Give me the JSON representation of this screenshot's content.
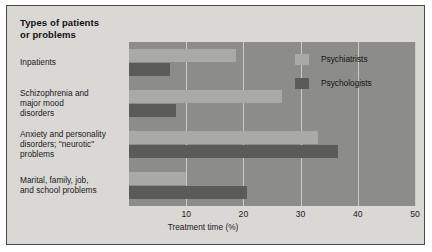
{
  "figure": {
    "panel_bg": "#d9d8d4",
    "plot_bg": "#8c8c8a",
    "border_color": "#4a4a48"
  },
  "legend": {
    "position": "top-right-inside-plot",
    "entries": [
      {
        "label": "Psychiatrists",
        "color": "#a9a9a6"
      },
      {
        "label": "Psychologists",
        "color": "#5b5b5a"
      }
    ]
  },
  "chart_data": {
    "type": "bar",
    "orientation": "horizontal",
    "xlabel": "Treatment time (%)",
    "ylabel": "",
    "xlim": [
      0,
      50
    ],
    "xticks": [
      10,
      20,
      30,
      40,
      50
    ],
    "xtick_labels": [
      "10",
      "20",
      "30",
      "40",
      "50"
    ],
    "grid": true,
    "grid_axis": "x",
    "legend_position": "upper right",
    "categories": [
      "Inpatients",
      "Schizophrenia and major mood disorders",
      "Anxiety and personality disorders; \"neurotic\" problems",
      "Marital, family, job, and school problems"
    ],
    "category_labels_display": [
      "Inpatients",
      "Schizophrenia and\nmajor mood\ndisorders",
      "Anxiety and personality\ndisorders; \"neurotic\"\nproblems",
      "Marital, family, job,\nand school problems"
    ],
    "series": [
      {
        "name": "Psychiatrists",
        "color": "#a9a9a6",
        "values": [
          18.7,
          26.7,
          33.0,
          10.0
        ]
      },
      {
        "name": "Psychologists",
        "color": "#5b5b5a",
        "values": [
          7.2,
          8.3,
          36.6,
          20.6
        ]
      }
    ]
  }
}
